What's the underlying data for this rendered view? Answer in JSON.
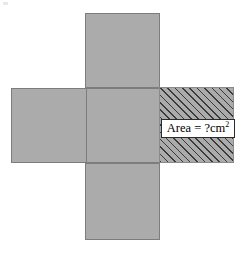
{
  "figure": {
    "type": "cube-net-diagram",
    "colors": {
      "square_fill": "#ababab",
      "square_border": "#7d7d7d",
      "hatch_line": "#3a3a3a",
      "label_box_fill": "#ffffff",
      "label_box_border": "#2b2b2b",
      "text": "#000000",
      "background": "#ffffff"
    },
    "squares": [
      {
        "id": "top",
        "label": "",
        "shaded": false
      },
      {
        "id": "left",
        "label": "",
        "shaded": false
      },
      {
        "id": "center",
        "label": "",
        "shaded": false
      },
      {
        "id": "bottom",
        "label": "",
        "shaded": false
      },
      {
        "id": "right",
        "label": "Area = ?cm2",
        "shaded": true
      }
    ],
    "label": {
      "prefix": "Area = ?cm",
      "superscript": "2",
      "full_text": "Area = ?cm2"
    }
  }
}
